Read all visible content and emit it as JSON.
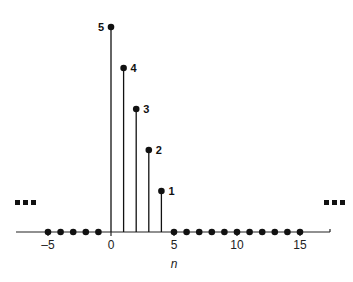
{
  "chart_data": {
    "type": "stem",
    "title": "",
    "xlabel": "n",
    "ylabel": "",
    "x": [
      -5,
      -4,
      -3,
      -2,
      -1,
      0,
      1,
      2,
      3,
      4,
      5,
      6,
      7,
      8,
      9,
      10,
      11,
      12,
      13,
      14,
      15
    ],
    "values": [
      0,
      0,
      0,
      0,
      0,
      5,
      4,
      3,
      2,
      1,
      0,
      0,
      0,
      0,
      0,
      0,
      0,
      0,
      0,
      0,
      0
    ],
    "point_labels": [
      {
        "n": 0,
        "label": "5"
      },
      {
        "n": 1,
        "label": "4"
      },
      {
        "n": 2,
        "label": "3"
      },
      {
        "n": 3,
        "label": "2"
      },
      {
        "n": 4,
        "label": "1"
      }
    ],
    "x_ticks": [
      -5,
      0,
      5,
      10,
      15
    ],
    "x_tick_labels": [
      "–5",
      "0",
      "5",
      "10",
      "15"
    ],
    "xlim": [
      -7.5,
      17.3
    ],
    "ylim": [
      0,
      5
    ],
    "grid": false,
    "continuation_marks": {
      "left": "▪▪▪",
      "right": "▪▪▪"
    }
  }
}
